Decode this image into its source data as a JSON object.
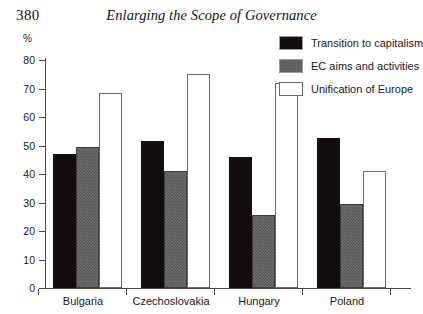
{
  "header": {
    "page_number": "380",
    "running_title": "Enlarging the Scope of Governance"
  },
  "chart_data": {
    "type": "bar",
    "title": "",
    "xlabel": "",
    "ylabel": "%",
    "ylim": [
      0,
      80
    ],
    "yticks": [
      0,
      10,
      20,
      30,
      40,
      50,
      60,
      70,
      80
    ],
    "ytick_labels": [
      "0",
      "10",
      "20",
      "30",
      "40",
      "50",
      "60",
      "70",
      "80"
    ],
    "grid": false,
    "legend_position": "top-right",
    "categories": [
      "Bulgaria",
      "Czechoslovakia",
      "Hungary",
      "Poland"
    ],
    "series": [
      {
        "name": "Transition to capitalism",
        "color": "#140d0d",
        "values": [
          47,
          51.5,
          46,
          52.5
        ]
      },
      {
        "name": "EC aims and activities",
        "color": "#6f6f6f",
        "values": [
          49.5,
          41,
          25.5,
          29.5
        ]
      },
      {
        "name": "Unification of Europe",
        "color": "#ffffff",
        "values": [
          68.5,
          75,
          72,
          41
        ]
      }
    ]
  }
}
